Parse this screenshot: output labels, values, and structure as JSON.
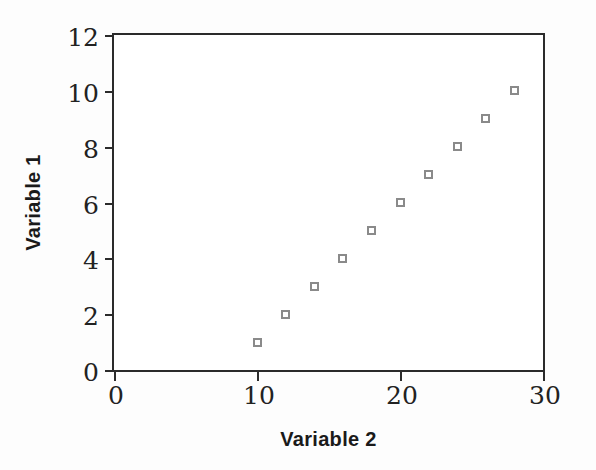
{
  "chart_data": {
    "type": "scatter",
    "title": "",
    "xlabel": "Variable 2",
    "ylabel": "Variable 1",
    "x": [
      10,
      12,
      14,
      16,
      18,
      20,
      22,
      24,
      26,
      28
    ],
    "y": [
      1,
      2,
      3,
      4,
      5,
      6,
      7,
      8,
      9,
      10
    ],
    "series": [
      {
        "name": "",
        "points": [
          {
            "x": 10,
            "y": 1
          },
          {
            "x": 12,
            "y": 2
          },
          {
            "x": 14,
            "y": 3
          },
          {
            "x": 16,
            "y": 4
          },
          {
            "x": 18,
            "y": 5
          },
          {
            "x": 20,
            "y": 6
          },
          {
            "x": 22,
            "y": 7
          },
          {
            "x": 24,
            "y": 8
          },
          {
            "x": 26,
            "y": 9
          },
          {
            "x": 28,
            "y": 10
          }
        ]
      }
    ],
    "xlim": [
      0,
      30
    ],
    "ylim": [
      0,
      12
    ],
    "xticks": [
      0,
      10,
      20,
      30
    ],
    "yticks": [
      0,
      2,
      4,
      6,
      8,
      10,
      12
    ],
    "xtick_labels": [
      "0",
      "10",
      "20",
      "30"
    ],
    "ytick_labels": [
      "0",
      "2",
      "4",
      "6",
      "8",
      "10",
      "12"
    ],
    "grid": false,
    "legend": false,
    "legend_position": "none",
    "marker": "open-square",
    "marker_color": "#8a8a8a",
    "marker_fill": "#ffffff",
    "axis_color": "#2b2b2b",
    "background_color": "#fdfdfd",
    "plot_background_color": "#ffffff"
  }
}
